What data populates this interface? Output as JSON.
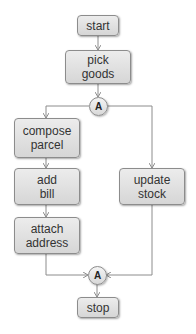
{
  "diagram": {
    "type": "flowchart",
    "nodes": {
      "start": {
        "label": "start"
      },
      "pick_goods": {
        "label": "pick\ngoods"
      },
      "fork": {
        "label": "A"
      },
      "compose_parcel": {
        "label": "compose\nparcel"
      },
      "add_bill": {
        "label": "add\nbill"
      },
      "attach_address": {
        "label": "attach\naddress"
      },
      "update_stock": {
        "label": "update\nstock"
      },
      "join": {
        "label": "A"
      },
      "stop": {
        "label": "stop"
      }
    },
    "edges": [
      [
        "start",
        "pick_goods"
      ],
      [
        "pick_goods",
        "fork"
      ],
      [
        "fork",
        "compose_parcel"
      ],
      [
        "fork",
        "update_stock"
      ],
      [
        "compose_parcel",
        "add_bill"
      ],
      [
        "add_bill",
        "attach_address"
      ],
      [
        "attach_address",
        "join"
      ],
      [
        "update_stock",
        "join"
      ],
      [
        "join",
        "stop"
      ]
    ],
    "colors": {
      "box_fill": "#e0e0e0",
      "border": "#8c8c8c",
      "line": "#8c8c8c",
      "text": "#333333"
    }
  }
}
